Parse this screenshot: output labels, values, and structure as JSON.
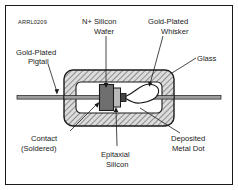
{
  "figure": {
    "id_code": "ARRL0209",
    "frame_color": "#1a1a1a",
    "background_color": "#ffffff"
  },
  "labels": {
    "pigtail": {
      "line1": "Gold-Plated",
      "line2": "Pigtail"
    },
    "wafer": {
      "line1": "N+ Silicon",
      "line2": "Wafer"
    },
    "whisker": {
      "line1": "Gold-Plated",
      "line2": "Whisker"
    },
    "glass": {
      "line1": "Glass",
      "line2": ""
    },
    "contact": {
      "line1": "Contact",
      "line2": "(Soldered)"
    },
    "epitaxial": {
      "line1": "Epitaxial",
      "line2": "Silicon"
    },
    "metal_dot": {
      "line1": "Deposited",
      "line2": "Metal Dot"
    }
  },
  "parts": {
    "glass_body": {
      "name": "Glass envelope",
      "fill": "#d9d9d9",
      "hatch": "diagonal"
    },
    "cavity": {
      "name": "Inner cavity",
      "fill": "#ffffff"
    },
    "wafer_block": {
      "name": "N+ Silicon Wafer",
      "fill": "#6e6e6e"
    },
    "epi_layer": {
      "name": "Epitaxial Silicon",
      "fill": "#b5b5b5"
    },
    "metal_dot": {
      "name": "Deposited Metal Dot",
      "fill": "#4a4a4a"
    },
    "whisker_wire": {
      "name": "Gold-Plated Whisker",
      "stroke": "#1a1a1a"
    },
    "lead_left": {
      "name": "Left gold-plated pigtail lead",
      "fill": "#9a9a9a"
    },
    "lead_right": {
      "name": "Right gold-plated pigtail lead",
      "fill": "#9a9a9a"
    }
  }
}
